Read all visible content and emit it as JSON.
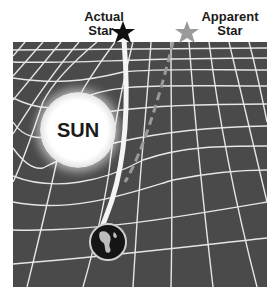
{
  "diagram": {
    "actual_star": {
      "line1": "Actual",
      "line2": "Star",
      "color": "#111111"
    },
    "apparent_star": {
      "line1": "Apparent",
      "line2": "Star",
      "color": "#9a9a9a"
    },
    "sun": {
      "label": "SUN"
    },
    "earth": {
      "label": "Earth"
    },
    "grid": {
      "background": "#4a4a4a",
      "line_color": "#e8e8e8"
    }
  }
}
